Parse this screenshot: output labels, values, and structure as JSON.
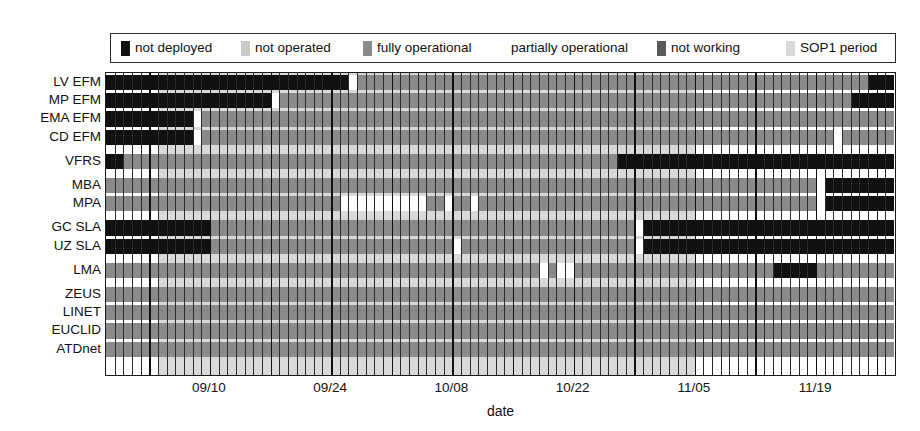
{
  "chart_data": {
    "type": "heatmap",
    "title": "",
    "xlabel": "date",
    "ylabel": "",
    "grid": true,
    "legend_position": "top",
    "n_days": 91,
    "x_axis": {
      "tick_labels": [
        "09/10",
        "09/24",
        "10/08",
        "10/22",
        "11/05",
        "11/19"
      ],
      "tick_days": [
        12,
        26,
        40,
        54,
        68,
        82
      ],
      "start_label": "08/29",
      "end_label": "11/27"
    },
    "status_colors": {
      "not deployed": "#111111",
      "not operated": "#c9c9c9",
      "fully operational": "#8a8a8a",
      "partially operational": "#ffffff",
      "not working": "#5a5a5a",
      "SOP1 period": "#d9d9d9"
    },
    "legend": [
      {
        "label": "not deployed",
        "color": "#111111",
        "swatch": true
      },
      {
        "label": "not operated",
        "color": "#c9c9c9",
        "swatch": true
      },
      {
        "label": "fully operational",
        "color": "#8a8a8a",
        "swatch": true
      },
      {
        "label": "partially operational",
        "color": "#ffffff",
        "swatch": false
      },
      {
        "label": "not working",
        "color": "#5a5a5a",
        "swatch": true
      },
      {
        "label": "SOP1 period",
        "color": "#d9d9d9",
        "swatch": true
      }
    ],
    "sop1_period": {
      "start_day": 6,
      "end_day": 68
    },
    "categories": [
      "LV EFM",
      "MP EFM",
      "EMA EFM",
      "CD EFM",
      "VFRS",
      "MBA",
      "MPA",
      "GC SLA",
      "UZ SLA",
      "LMA",
      "ZEUS",
      "LINET",
      "EUCLID",
      "ATDnet"
    ],
    "rows": [
      {
        "name": "LV EFM",
        "group": 0,
        "segments": [
          {
            "from": 0,
            "to": 28,
            "status": "not deployed"
          },
          {
            "from": 28,
            "to": 29,
            "status": "partially operational"
          },
          {
            "from": 29,
            "to": 88,
            "status": "fully operational"
          },
          {
            "from": 88,
            "to": 91,
            "status": "not deployed"
          }
        ]
      },
      {
        "name": "MP EFM",
        "group": 0,
        "segments": [
          {
            "from": 0,
            "to": 19,
            "status": "not deployed"
          },
          {
            "from": 19,
            "to": 20,
            "status": "partially operational"
          },
          {
            "from": 20,
            "to": 86,
            "status": "fully operational"
          },
          {
            "from": 86,
            "to": 91,
            "status": "not deployed"
          }
        ]
      },
      {
        "name": "EMA EFM",
        "group": 0,
        "segments": [
          {
            "from": 0,
            "to": 10,
            "status": "not deployed"
          },
          {
            "from": 10,
            "to": 11,
            "status": "partially operational"
          },
          {
            "from": 11,
            "to": 91,
            "status": "fully operational"
          }
        ]
      },
      {
        "name": "CD EFM",
        "group": 0,
        "segments": [
          {
            "from": 0,
            "to": 10,
            "status": "not deployed"
          },
          {
            "from": 10,
            "to": 11,
            "status": "partially operational"
          },
          {
            "from": 11,
            "to": 84,
            "status": "fully operational"
          },
          {
            "from": 84,
            "to": 85,
            "status": "partially operational"
          },
          {
            "from": 85,
            "to": 91,
            "status": "fully operational"
          }
        ]
      },
      {
        "name": "VFRS",
        "group": 1,
        "segments": [
          {
            "from": 0,
            "to": 2,
            "status": "not deployed"
          },
          {
            "from": 2,
            "to": 59,
            "status": "fully operational"
          },
          {
            "from": 59,
            "to": 91,
            "status": "not deployed"
          }
        ]
      },
      {
        "name": "MBA",
        "group": 2,
        "segments": [
          {
            "from": 0,
            "to": 82,
            "status": "fully operational"
          },
          {
            "from": 82,
            "to": 83,
            "status": "partially operational"
          },
          {
            "from": 83,
            "to": 91,
            "status": "not deployed"
          }
        ]
      },
      {
        "name": "MPA",
        "group": 2,
        "segments": [
          {
            "from": 0,
            "to": 27,
            "status": "fully operational"
          },
          {
            "from": 27,
            "to": 37,
            "status": "partially operational"
          },
          {
            "from": 37,
            "to": 39,
            "status": "fully operational"
          },
          {
            "from": 39,
            "to": 40,
            "status": "partially operational"
          },
          {
            "from": 40,
            "to": 42,
            "status": "fully operational"
          },
          {
            "from": 42,
            "to": 43,
            "status": "partially operational"
          },
          {
            "from": 43,
            "to": 82,
            "status": "fully operational"
          },
          {
            "from": 82,
            "to": 83,
            "status": "partially operational"
          },
          {
            "from": 83,
            "to": 91,
            "status": "not deployed"
          }
        ]
      },
      {
        "name": "GC SLA",
        "group": 3,
        "segments": [
          {
            "from": 0,
            "to": 12,
            "status": "not deployed"
          },
          {
            "from": 12,
            "to": 61,
            "status": "fully operational"
          },
          {
            "from": 61,
            "to": 62,
            "status": "partially operational"
          },
          {
            "from": 62,
            "to": 91,
            "status": "not deployed"
          }
        ]
      },
      {
        "name": "UZ SLA",
        "group": 3,
        "segments": [
          {
            "from": 0,
            "to": 12,
            "status": "not deployed"
          },
          {
            "from": 12,
            "to": 40,
            "status": "fully operational"
          },
          {
            "from": 40,
            "to": 41,
            "status": "partially operational"
          },
          {
            "from": 41,
            "to": 61,
            "status": "fully operational"
          },
          {
            "from": 61,
            "to": 62,
            "status": "partially operational"
          },
          {
            "from": 62,
            "to": 91,
            "status": "not deployed"
          }
        ]
      },
      {
        "name": "LMA",
        "group": 4,
        "segments": [
          {
            "from": 0,
            "to": 50,
            "status": "fully operational"
          },
          {
            "from": 50,
            "to": 51,
            "status": "partially operational"
          },
          {
            "from": 51,
            "to": 52,
            "status": "fully operational"
          },
          {
            "from": 52,
            "to": 54,
            "status": "partially operational"
          },
          {
            "from": 54,
            "to": 77,
            "status": "fully operational"
          },
          {
            "from": 77,
            "to": 82,
            "status": "not deployed"
          },
          {
            "from": 82,
            "to": 91,
            "status": "fully operational"
          }
        ]
      },
      {
        "name": "ZEUS",
        "group": 5,
        "segments": [
          {
            "from": 0,
            "to": 91,
            "status": "fully operational"
          }
        ]
      },
      {
        "name": "LINET",
        "group": 5,
        "segments": [
          {
            "from": 0,
            "to": 91,
            "status": "fully operational"
          }
        ]
      },
      {
        "name": "EUCLID",
        "group": 5,
        "segments": [
          {
            "from": 0,
            "to": 91,
            "status": "fully operational"
          }
        ]
      },
      {
        "name": "ATDnet",
        "group": 5,
        "segments": [
          {
            "from": 0,
            "to": 91,
            "status": "fully operational"
          }
        ]
      }
    ]
  }
}
